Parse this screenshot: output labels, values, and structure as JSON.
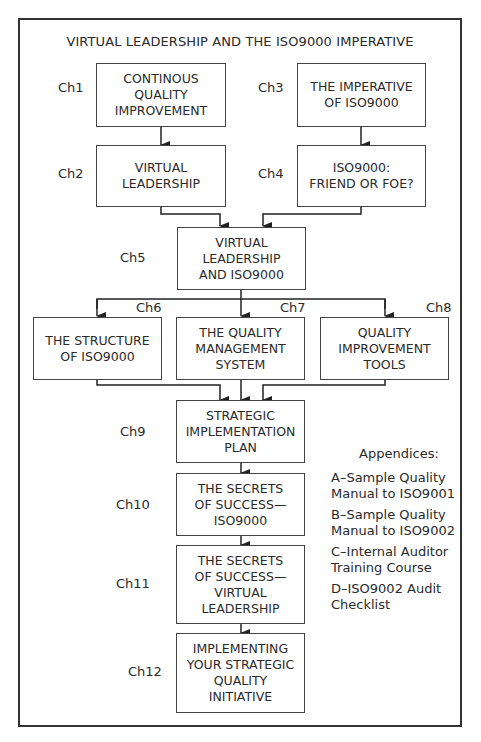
{
  "title": "VIRTUAL LEADERSHIP AND THE ISO9000 IMPERATIVE",
  "chapters": [
    {
      "label": "Ch1",
      "text": "CONTINOUS\nQUALITY\nIMPROVEMENT"
    },
    {
      "label": "Ch2",
      "text": "VIRTUAL\nLEADERSHIP"
    },
    {
      "label": "Ch3",
      "text": "THE IMPERATIVE\nOF ISO9000"
    },
    {
      "label": "Ch4",
      "text": "ISO9000:\nFRIEND OR FOE?"
    },
    {
      "label": "Ch5",
      "text": "VIRTUAL\nLEADERSHIP\nAND ISO9000"
    },
    {
      "label": "Ch6",
      "text": "THE STRUCTURE\nOF ISO9000"
    },
    {
      "label": "Ch7",
      "text": "THE QUALITY\nMANAGEMENT\nSYSTEM"
    },
    {
      "label": "Ch8",
      "text": "QUALITY\nIMPROVEMENT\nTOOLS"
    },
    {
      "label": "Ch9",
      "text": "STRATEGIC\nIMPLEMENTATION\nPLAN"
    },
    {
      "label": "Ch10",
      "text": "THE SECRETS\nOF SUCCESS—\nISO9000"
    },
    {
      "label": "Ch11",
      "text": "THE SECRETS\nOF SUCCESS—\nVIRTUAL\nLEADERSHIP"
    },
    {
      "label": "Ch12",
      "text": "IMPLEMENTING\nYOUR STRATEGIC\nQUALITY\nINITIATIVE"
    }
  ],
  "appendices": {
    "heading": "Appendices:",
    "items": [
      "A–Sample Quality\nManual to ISO9001",
      "B–Sample Quality\nManual to ISO9002",
      "C–Internal Auditor\nTraining Course",
      "D–ISO9002 Audit\nChecklist"
    ]
  }
}
